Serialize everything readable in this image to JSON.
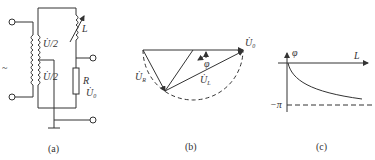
{
  "panels": [
    {
      "id": "a",
      "caption": "(a)",
      "type": "circuit",
      "labels": {
        "upper_winding": "U̇/2",
        "lower_winding": "U̇/2",
        "inductor": "L",
        "resistor": "R",
        "output": "U̇",
        "output_sub": "0",
        "input_mark": "~"
      }
    },
    {
      "id": "b",
      "caption": "(b)",
      "type": "phasor-diagram",
      "labels": {
        "u0": "U̇",
        "u0_sub": "0",
        "ur": "U̇",
        "ur_sub": "R",
        "ul": "U̇",
        "ul_sub": "L",
        "phi": "φ"
      }
    },
    {
      "id": "c",
      "caption": "(c)",
      "type": "phase-curve",
      "labels": {
        "y_axis": "φ",
        "x_axis": "L",
        "asymptote": "−π"
      }
    }
  ],
  "colors": {
    "stroke": "#333333",
    "background": "#ffffff"
  }
}
